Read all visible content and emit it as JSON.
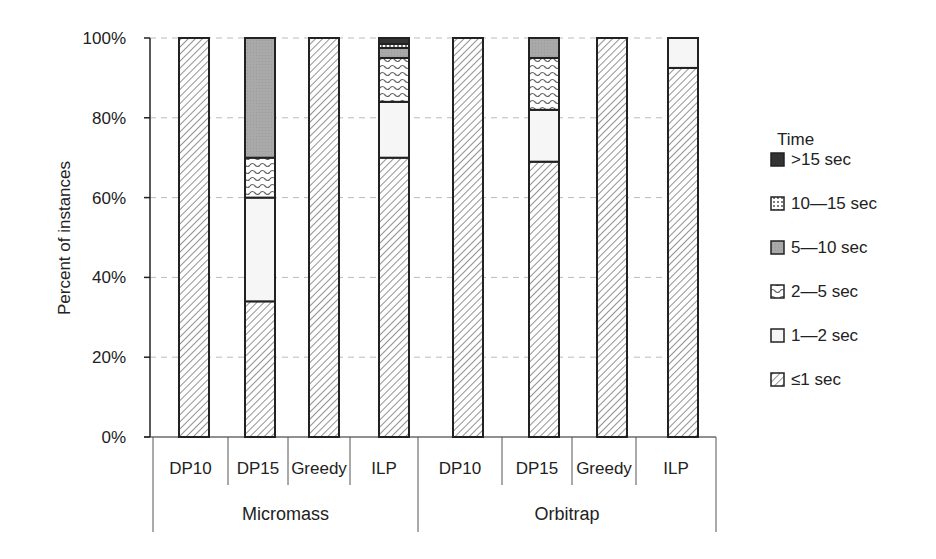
{
  "chart_data": {
    "type": "bar",
    "stacked": true,
    "title": "",
    "xlabel": "",
    "ylabel": "Percent of instances",
    "ylim": [
      0,
      100
    ],
    "yticks": [
      "0%",
      "20%",
      "40%",
      "60%",
      "80%",
      "100%"
    ],
    "grid": "horizontal dashed",
    "legend_position": "right",
    "legend_title": "Time",
    "groups": [
      {
        "name": "Micromass",
        "categories": [
          "DP10",
          "DP15",
          "Greedy",
          "ILP"
        ]
      },
      {
        "name": "Orbitrap",
        "categories": [
          "DP10",
          "DP15",
          "Greedy",
          "ILP"
        ]
      }
    ],
    "categories": [
      "Micromass DP10",
      "Micromass DP15",
      "Micromass Greedy",
      "Micromass ILP",
      "Orbitrap DP10",
      "Orbitrap DP15",
      "Orbitrap Greedy",
      "Orbitrap ILP"
    ],
    "series": [
      {
        "name": "≤1 sec",
        "pattern": "diagonal",
        "values": [
          100,
          34,
          100,
          70,
          100,
          69,
          100,
          92.5
        ]
      },
      {
        "name": "1—2 sec",
        "pattern": "light",
        "values": [
          0,
          26,
          0,
          14,
          0,
          13,
          0,
          7.5
        ]
      },
      {
        "name": "2—5 sec",
        "pattern": "wave",
        "values": [
          0,
          10,
          0,
          11,
          0,
          13,
          0,
          0
        ]
      },
      {
        "name": "5—10 sec",
        "pattern": "gray",
        "values": [
          0,
          30,
          0,
          2.5,
          0,
          5,
          0,
          0
        ]
      },
      {
        "name": "10—15 sec",
        "pattern": "dots",
        "values": [
          0,
          0,
          0,
          1,
          0,
          0,
          0,
          0
        ]
      },
      {
        "name": ">15 sec",
        "pattern": "dark",
        "values": [
          0,
          0,
          0,
          1.5,
          0,
          0,
          0,
          0
        ]
      }
    ]
  },
  "legend": {
    "title": "Time",
    "items": [
      {
        "label": ">15 sec",
        "pattern": "dark"
      },
      {
        "label": "10—15 sec",
        "pattern": "dots"
      },
      {
        "label": "5—10 sec",
        "pattern": "gray"
      },
      {
        "label": "2—5 sec",
        "pattern": "wave"
      },
      {
        "label": "1—2 sec",
        "pattern": "light"
      },
      {
        "label": "≤1 sec",
        "pattern": "diagonal"
      }
    ]
  },
  "colors": {
    "axis": "#222222",
    "grid": "#bbbbbb",
    "gray_fill": "#a8a8a8",
    "dark_fill": "#333333",
    "light_fill": "#f4f4f4"
  }
}
